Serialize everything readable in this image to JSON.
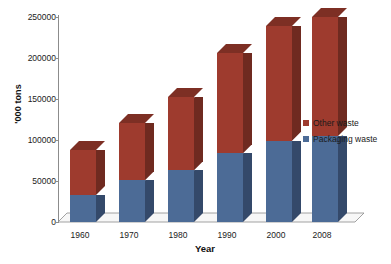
{
  "chart_data": {
    "type": "bar",
    "stacked": true,
    "title": "",
    "xlabel": "Year",
    "ylabel": "'000 tons",
    "categories": [
      "1960",
      "1970",
      "1980",
      "1990",
      "2000",
      "2008"
    ],
    "series": [
      {
        "name": "Packaging waste",
        "color": "#4c6b96",
        "values": [
          33000,
          51000,
          63000,
          84000,
          99000,
          105000
        ]
      },
      {
        "name": "Other waste",
        "color": "#9e3b2e",
        "values": [
          55000,
          70000,
          89000,
          122000,
          140000,
          145000
        ]
      }
    ],
    "totals": [
      88000,
      121000,
      152000,
      206000,
      239000,
      250000
    ],
    "ylim": [
      0,
      250000
    ],
    "yticks": [
      "0",
      "50000",
      "100000",
      "150000",
      "200000",
      "250000"
    ],
    "ytick_values": [
      0,
      50000,
      100000,
      150000,
      200000,
      250000
    ],
    "grid": false,
    "legend_position": "right",
    "style": "3d-column",
    "legend": [
      "Other waste",
      "Packaging waste"
    ]
  },
  "axes": {
    "y_title": "'000 tons",
    "x_title": "Year",
    "y_labels": [
      "250000",
      "200000",
      "150000",
      "100000",
      "50000",
      "0"
    ],
    "x_labels": [
      "1960",
      "1970",
      "1980",
      "1990",
      "2000",
      "2008"
    ]
  },
  "legend": {
    "items": [
      {
        "label": "Other waste",
        "color": "#9e3b2e"
      },
      {
        "label": "Packaging waste",
        "color": "#4c6b96"
      }
    ]
  },
  "colors": {
    "red_front": "#9e3b2e",
    "red_side": "#6f2a20",
    "red_cap": "#7d2f24",
    "blue_front": "#4c6b96",
    "blue_side": "#34496a",
    "axis": "#8c8c8c",
    "floor": "#f2f2f2",
    "background": "#ffffff"
  }
}
